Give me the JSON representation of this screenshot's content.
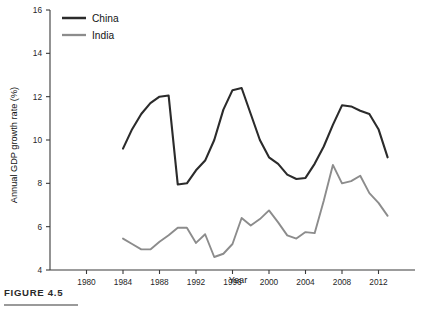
{
  "figure": {
    "caption": "FIGURE 4.5"
  },
  "chart_data": {
    "type": "line",
    "title": "",
    "xlabel": "Year",
    "ylabel": "Annual GDP growth rate (%)",
    "xlim": [
      1976,
      2016
    ],
    "ylim": [
      4,
      16
    ],
    "xticks": [
      1980,
      1984,
      1988,
      1992,
      1996,
      2000,
      2004,
      2008,
      2012
    ],
    "yticks": [
      4,
      6,
      8,
      10,
      12,
      14,
      16
    ],
    "grid": false,
    "legend_position": "top-left",
    "series": [
      {
        "name": "China",
        "color": "#2b2b2b",
        "width": 2.1,
        "x": [
          1984,
          1985,
          1986,
          1987,
          1988,
          1989,
          1990,
          1991,
          1992,
          1993,
          1994,
          1995,
          1996,
          1997,
          1998,
          1999,
          2000,
          2001,
          2002,
          2003,
          2004,
          2005,
          2006,
          2007,
          2008,
          2009,
          2010,
          2011,
          2012,
          2013
        ],
        "values": [
          9.6,
          10.5,
          11.2,
          11.7,
          12.0,
          12.05,
          7.95,
          8.0,
          8.6,
          9.05,
          10.0,
          11.4,
          12.3,
          12.4,
          11.2,
          10.0,
          9.2,
          8.9,
          8.4,
          8.2,
          8.25,
          8.9,
          9.7,
          10.7,
          11.6,
          11.55,
          11.35,
          11.2,
          10.5,
          9.2
        ]
      },
      {
        "name": "India",
        "color": "#8c8c8c",
        "width": 1.9,
        "x": [
          1984,
          1985,
          1986,
          1987,
          1988,
          1989,
          1990,
          1991,
          1992,
          1993,
          1994,
          1995,
          1996,
          1997,
          1998,
          1999,
          2000,
          2001,
          2002,
          2003,
          2004,
          2005,
          2006,
          2007,
          2008,
          2009,
          2010,
          2011,
          2012,
          2013
        ],
        "values": [
          5.45,
          5.2,
          4.95,
          4.95,
          5.3,
          5.6,
          5.95,
          5.95,
          5.25,
          5.65,
          4.6,
          4.75,
          5.2,
          6.4,
          6.05,
          6.35,
          6.75,
          6.2,
          5.6,
          5.45,
          5.75,
          5.7,
          7.2,
          8.85,
          8.0,
          8.1,
          8.35,
          7.55,
          7.1,
          6.5
        ]
      }
    ]
  }
}
